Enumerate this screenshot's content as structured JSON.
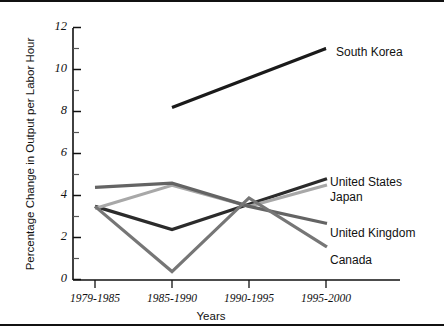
{
  "figure": {
    "background_color": "#ffffff",
    "frame_color": "#111111"
  },
  "chart_data": {
    "type": "line",
    "title": "",
    "xlabel": "Years",
    "ylabel": "Percentage Change in Output per Labor Hour",
    "categories": [
      "1979-1985",
      "1985-1990",
      "1990-1995",
      "1995-2000"
    ],
    "ylim": [
      0,
      12
    ],
    "yticks_major": [
      0,
      2,
      4,
      6,
      8,
      10,
      12
    ],
    "yticks_minor": [
      1,
      3,
      5,
      7,
      9,
      11
    ],
    "grid": false,
    "legend_position": "right-inline-labels",
    "series": [
      {
        "name": "South Korea",
        "color": "#1a1a1a",
        "values": [
          null,
          8.2,
          null,
          11.0
        ]
      },
      {
        "name": "United States",
        "color": "#2b2b2b",
        "values": [
          3.5,
          2.4,
          3.6,
          4.8
        ]
      },
      {
        "name": "Japan",
        "color": "#a8a8a8",
        "values": [
          3.4,
          4.5,
          3.5,
          4.5
        ]
      },
      {
        "name": "United Kingdom",
        "color": "#646464",
        "values": [
          4.4,
          4.6,
          3.5,
          2.7
        ]
      },
      {
        "name": "Canada",
        "color": "#767676",
        "values": [
          3.5,
          0.4,
          3.9,
          1.6
        ]
      }
    ]
  },
  "axis": {
    "y_tick_labels": [
      "0",
      "2",
      "4",
      "6",
      "8",
      "10",
      "12"
    ],
    "x_tick_labels": [
      "1979-1985",
      "1985-1990",
      "1990-1995",
      "1995-2000"
    ],
    "x_axis_title": "Years",
    "y_axis_title": "Percentage Change in Output per Labor Hour"
  },
  "series_labels": [
    {
      "text": "South Korea",
      "x": 336,
      "y": 51
    },
    {
      "text": "United States",
      "x": 330,
      "y": 181
    },
    {
      "text": "Japan",
      "x": 330,
      "y": 196
    },
    {
      "text": "United Kingdom",
      "x": 330,
      "y": 232
    },
    {
      "text": "Canada",
      "x": 330,
      "y": 259
    }
  ]
}
